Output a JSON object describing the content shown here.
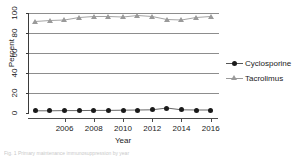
{
  "chart_data": {
    "type": "line",
    "title": "",
    "xlabel": "Year",
    "ylabel": "Percent",
    "x": [
      2004,
      2005,
      2006,
      2007,
      2008,
      2009,
      2010,
      2011,
      2012,
      2013,
      2014,
      2015,
      2016
    ],
    "xlim": [
      2003.5,
      2016.5
    ],
    "ylim": [
      0,
      100
    ],
    "yticks": [
      0,
      20,
      40,
      60,
      80,
      100
    ],
    "xticks": [
      2006,
      2008,
      2010,
      2012,
      2014,
      2016
    ],
    "xtick_labels": [
      "2006",
      "2008",
      "2010",
      "2012",
      "2014",
      "2016"
    ],
    "ytick_labels": [
      "0",
      "20",
      "40",
      "60",
      "80",
      "100"
    ],
    "grid": "horizontal",
    "legend_position": "right",
    "series": [
      {
        "name": "Cyclosporine",
        "marker": "circle",
        "color": "#1a1a1a",
        "line_color": "#555555",
        "values": [
          2.2,
          2.2,
          2.4,
          2.4,
          2.6,
          2.6,
          2.8,
          3.0,
          3.2,
          5.0,
          3.2,
          3.0,
          3.0
        ]
      },
      {
        "name": "Tacrolimus",
        "marker": "triangle",
        "color": "#9a9a9a",
        "line_color": "#9a9a9a",
        "values": [
          91.5,
          92.5,
          93.0,
          95.5,
          96.5,
          96.5,
          96.0,
          97.5,
          96.5,
          93.5,
          93.0,
          95.5,
          96.5
        ]
      }
    ]
  },
  "legend": {
    "items": [
      {
        "label": "Cyclosporine"
      },
      {
        "label": "Tacrolimus"
      }
    ]
  },
  "caption": {
    "text": "Fig. 1 Primary maintenance immunosuppression by year"
  },
  "colors": {
    "cyclosporine": "#1a1a1a",
    "tacrolimus": "#9a9a9a",
    "grid": "#8d8d8d",
    "axis": "#3b3b3b"
  }
}
